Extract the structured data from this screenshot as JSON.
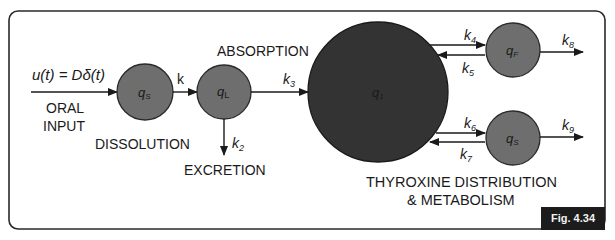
{
  "diagram": {
    "type": "compartmental-model",
    "colors": {
      "border": "#2a2a2a",
      "small_compartment": "#6e6e6e",
      "central_compartment": "#333333",
      "arrow": "#1a1a1a",
      "text": "#1a1a1a",
      "badge_bg": "#1c1c1c",
      "badge_text": "#f2f2f2"
    },
    "input": {
      "equation": "u(t) = Dδ(t)",
      "label_line1": "ORAL",
      "label_line2": "INPUT"
    },
    "compartments": [
      {
        "id": "qs",
        "label": "q",
        "sub": "S"
      },
      {
        "id": "qL",
        "label": "q",
        "sub": "L"
      },
      {
        "id": "q1",
        "label": "q",
        "sub": "1"
      },
      {
        "id": "qF",
        "label": "q",
        "sub": "F"
      },
      {
        "id": "qS",
        "label": "q",
        "sub": "S"
      }
    ],
    "rates": {
      "k": "k",
      "k2": {
        "base": "k",
        "sub": "2"
      },
      "k3": {
        "base": "k",
        "sub": "3"
      },
      "k4": {
        "base": "k",
        "sub": "4"
      },
      "k5": {
        "base": "k",
        "sub": "5"
      },
      "k6": {
        "base": "k",
        "sub": "6"
      },
      "k7": {
        "base": "k",
        "sub": "7"
      },
      "k8": {
        "base": "k",
        "sub": "8"
      },
      "k9": {
        "base": "k",
        "sub": "9"
      }
    },
    "labels": {
      "dissolution": "DISSOLUTION",
      "excretion": "EXCRETION",
      "absorption": "ABSORPTION",
      "distribution_line1": "THYROXINE DISTRIBUTION",
      "distribution_line2": "& METABOLISM"
    },
    "figure_label": "Fig. 4.34"
  }
}
